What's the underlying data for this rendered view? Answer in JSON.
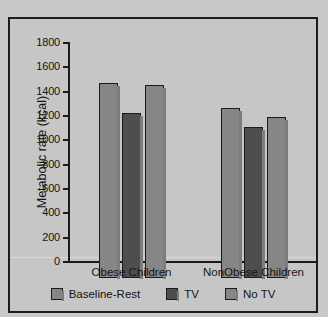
{
  "chart_data": {
    "type": "bar",
    "title": "",
    "xlabel": "",
    "ylabel": "Metabolic rate (kcal)",
    "ylim": [
      0,
      1800
    ],
    "ytick_step": 200,
    "yticks": [
      1800,
      1600,
      1400,
      1200,
      1000,
      800,
      600,
      400,
      200,
      0
    ],
    "ytick_labels": [
      "1800",
      "1600",
      "1400",
      "1200",
      "1000",
      "800",
      "600",
      "400",
      "200",
      "0"
    ],
    "categories": [
      "Obese Children",
      "NonObese Children"
    ],
    "grid": false,
    "legend_position": "bottom",
    "series": [
      {
        "name": "Baseline-Rest",
        "color": "#868686",
        "values": [
          1600,
          1400
        ]
      },
      {
        "name": "TV",
        "color": "#4e4e4e",
        "values": [
          1360,
          1245
        ]
      },
      {
        "name": "No TV",
        "color": "#868686",
        "values": [
          1590,
          1320
        ]
      }
    ]
  },
  "legend": {
    "items": [
      {
        "label": "Baseline-Rest",
        "swatch_color": "#868686"
      },
      {
        "label": "TV",
        "swatch_color": "#4e4e4e"
      },
      {
        "label": "No TV",
        "swatch_color": "#868686"
      }
    ]
  },
  "colors": {
    "background": "#c9c9c9",
    "panel": "#c6c6c6",
    "axis": "#1b1b1b",
    "text": "#141414",
    "bar_light": "#868686",
    "bar_dark": "#4e4e4e",
    "bar_shadow": "#7d7d7d"
  }
}
